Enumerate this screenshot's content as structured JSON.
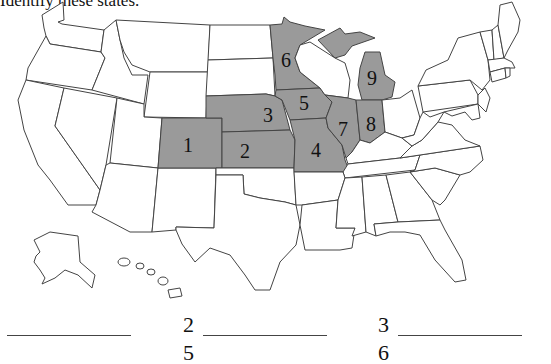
{
  "instructions": "Identify these states.",
  "map": {
    "highlight_color": "#9a9a9a",
    "highlighted_states": [
      {
        "number": "1",
        "state": "Colorado"
      },
      {
        "number": "2",
        "state": "Kansas"
      },
      {
        "number": "3",
        "state": "Nebraska"
      },
      {
        "number": "4",
        "state": "Missouri"
      },
      {
        "number": "5",
        "state": "Iowa"
      },
      {
        "number": "6",
        "state": "Minnesota"
      },
      {
        "number": "7",
        "state": "Illinois"
      },
      {
        "number": "8",
        "state": "Indiana"
      },
      {
        "number": "9",
        "state": "Michigan"
      }
    ]
  },
  "answer_blanks": [
    {
      "number": "1",
      "value": ""
    },
    {
      "number": "2",
      "value": ""
    },
    {
      "number": "3",
      "value": ""
    },
    {
      "number": "5",
      "value": ""
    },
    {
      "number": "6",
      "value": ""
    }
  ]
}
